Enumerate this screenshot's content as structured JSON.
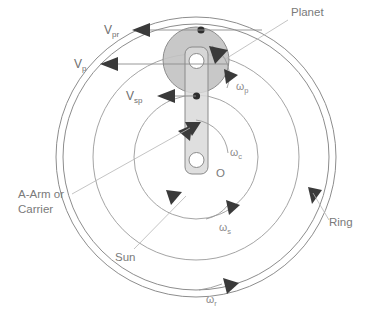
{
  "figure": {
    "background_color": "#ffffff",
    "line_color": "#8d8d8d",
    "label_color": "#6e6e6e",
    "planet_fill": "#c2c2c2",
    "carrier_fill": "#d9d9d9",
    "arrow_color": "#3a3a3a"
  },
  "labels": {
    "planet": "Planet",
    "ring": "Ring",
    "sun": "Sun",
    "carrier_line1": "A-Arm or",
    "carrier_line2": "Carrier",
    "center_point": "O"
  },
  "velocities": [
    {
      "name": "v-pr",
      "symbol": "V",
      "subscript": "pr"
    },
    {
      "name": "v-p",
      "symbol": "V",
      "subscript": "p"
    },
    {
      "name": "v-sp",
      "symbol": "V",
      "subscript": "sp"
    }
  ],
  "angular_velocities": [
    {
      "name": "omega-p",
      "symbol": "ω",
      "subscript": "p"
    },
    {
      "name": "omega-c",
      "symbol": "ω",
      "subscript": "c"
    },
    {
      "name": "omega-s",
      "symbol": "ω",
      "subscript": "s"
    },
    {
      "name": "omega-r",
      "symbol": "ω",
      "subscript": "r"
    }
  ],
  "geometry": {
    "center": {
      "x": 196,
      "y": 157
    },
    "ring_outer_radius": 140,
    "ring_inner_radius": 133,
    "carrier_orbit_radius": 103,
    "sun_radius": 62,
    "planet": {
      "cx": 196,
      "cy": 60,
      "r": 33
    },
    "carrier_arm": {
      "x": 185,
      "y": 47,
      "width": 23,
      "height": 127
    }
  }
}
